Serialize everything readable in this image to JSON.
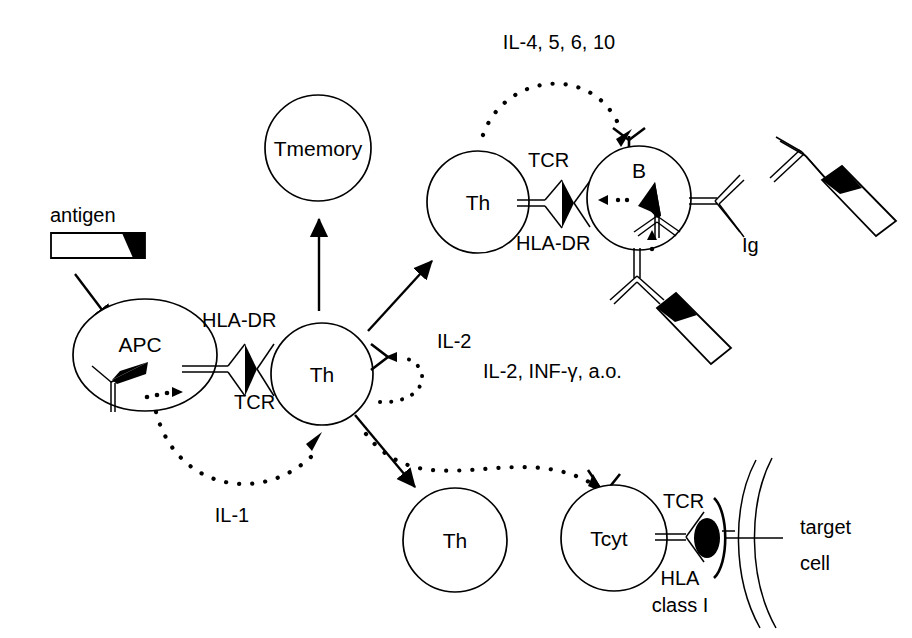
{
  "figure": {
    "kind": "immune-response-schematic",
    "background_color": "#ffffff",
    "line_color": "#000000"
  },
  "labels": {
    "antigen": "antigen",
    "apc": "APC",
    "hla_dr_apc": "HLA-DR",
    "tcr_apc_th": "TCR",
    "th_center": "Th",
    "tmemory": "Tmemory",
    "il1": "IL-1",
    "il2": "IL-2",
    "th_upper": "Th",
    "tcr_th_b": "TCR",
    "hla_dr_b": "HLA-DR",
    "b_cell": "B",
    "ig": "Ig",
    "il4_5_6_10": "IL-4, 5, 6, 10",
    "il2_infg_ao": "IL-2, INF-γ, a.o.",
    "th_lower": "Th",
    "tcyt": "Tcyt",
    "tcr_tcyt": "TCR",
    "hla_class_i_line1": "HLA",
    "hla_class_i_line2": "class I",
    "target_cell_line1": "target",
    "target_cell_line2": "cell"
  },
  "cells": [
    {
      "name": "APC",
      "cx": 145,
      "cy": 355,
      "rx": 72,
      "ry": 56,
      "label": "APC"
    },
    {
      "name": "Th-center",
      "cx": 322,
      "cy": 374,
      "rx": 51,
      "ry": 52,
      "label": "Th"
    },
    {
      "name": "Tmemory",
      "cx": 318,
      "cy": 148,
      "rx": 53,
      "ry": 53,
      "label": "Tmemory"
    },
    {
      "name": "Th-upper",
      "cx": 478,
      "cy": 202,
      "rx": 51,
      "ry": 51,
      "label": "Th"
    },
    {
      "name": "B",
      "cx": 639,
      "cy": 198,
      "rx": 52,
      "ry": 52,
      "label": "B"
    },
    {
      "name": "Th-lower",
      "cx": 455,
      "cy": 540,
      "rx": 52,
      "ry": 52,
      "label": "Th"
    },
    {
      "name": "Tcyt",
      "cx": 614,
      "cy": 538,
      "rx": 53,
      "ry": 53,
      "label": "Tcyt"
    }
  ],
  "cytokine_arrows": [
    {
      "name": "il-1",
      "label": "IL-1",
      "from": "APC",
      "to": "Th-center"
    },
    {
      "name": "il-2",
      "label": "IL-2",
      "from": "Th-center",
      "to": "Th-center"
    },
    {
      "name": "il-4-5-6-10",
      "label": "IL-4, 5, 6, 10",
      "from": "Th-upper",
      "to": "B"
    },
    {
      "name": "il-2-infg",
      "label": "IL-2, INF-γ, a.o.",
      "from": "Th-center",
      "to": "Tcyt"
    }
  ],
  "solid_arrows": [
    {
      "name": "antigen-to-apc",
      "from": "antigen",
      "to": "APC"
    },
    {
      "name": "th-to-tmemory",
      "from": "Th-center",
      "to": "Tmemory"
    },
    {
      "name": "th-to-th-upper",
      "from": "Th-center",
      "to": "Th-upper"
    },
    {
      "name": "th-to-th-lower",
      "from": "Th-center",
      "to": "Th-lower"
    }
  ],
  "molecules": [
    {
      "name": "antigen-bar",
      "type": "bar-with-black-epitope"
    },
    {
      "name": "apc-antibody",
      "type": "y-receptor-with-epitope"
    },
    {
      "name": "apc-th-mhc-tcr",
      "type": "mhc-peptide-tcr-junction"
    },
    {
      "name": "th-b-mhc-tcr",
      "type": "mhc-peptide-tcr-junction"
    },
    {
      "name": "b-surface-ig-right",
      "type": "y-antibody"
    },
    {
      "name": "b-surface-ig-bottom",
      "type": "y-antibody-with-antigen"
    },
    {
      "name": "free-antibody-antigen",
      "type": "y-antibody-with-antigen"
    },
    {
      "name": "tcyt-tcr-hla-class-i",
      "type": "tcr-hla-class-i-junction"
    },
    {
      "name": "target-cell-membrane",
      "type": "double-arc-membrane"
    }
  ]
}
